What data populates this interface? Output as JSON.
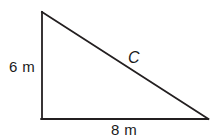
{
  "figure": {
    "kind": "right-triangle-diagram",
    "background_color": "#ffffff",
    "stroke_color": "#231f20",
    "text_color": "#1a1a1a",
    "stroke_width": 1.8,
    "labels": {
      "vertical_leg": "6 m",
      "horizontal_leg": "8 m",
      "hypotenuse": "C"
    },
    "geometry": {
      "apex": [
        42,
        12
      ],
      "right_angle_corner": [
        42,
        119
      ],
      "far_corner": [
        208,
        119
      ],
      "vertical_leg_length_m": 6,
      "horizontal_leg_length_m": 8,
      "hypotenuse_name": "C"
    }
  }
}
